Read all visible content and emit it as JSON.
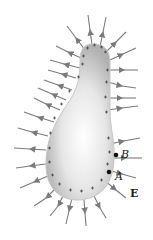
{
  "diagram": {
    "labels": {
      "point_b": "B",
      "point_a": "A",
      "field": "E"
    },
    "surface_charge_symbol": "+",
    "colors": {
      "field_line": "#7a7a7a",
      "conductor_edge": "#b5b5b5",
      "conductor_center": "#ffffff",
      "charge": "#444444",
      "point": "#111111"
    }
  }
}
